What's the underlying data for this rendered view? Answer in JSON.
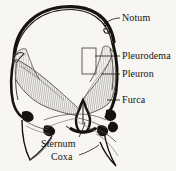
{
  "figure": {
    "background_color": "#f7f6f2",
    "ink_color": "#16120f",
    "hatch_color": "#8d8a84",
    "width": 176,
    "height": 171
  },
  "labels": [
    {
      "id": "notum",
      "text": "Notum",
      "x": 122,
      "y": 13,
      "leader_from": [
        120,
        18
      ],
      "leader_to": [
        104,
        23
      ]
    },
    {
      "id": "pleurodema",
      "text": "Pleurodema",
      "x": 122,
      "y": 51,
      "leader_from": [
        120,
        56
      ],
      "leader_to": [
        94,
        56
      ]
    },
    {
      "id": "pleuron",
      "text": "Pleuron",
      "x": 122,
      "y": 69,
      "leader_from": [
        120,
        74
      ],
      "leader_to": [
        101,
        74
      ]
    },
    {
      "id": "furca",
      "text": "Furca",
      "x": 122,
      "y": 95,
      "leader_from": [
        120,
        100
      ],
      "leader_to": [
        106,
        100
      ]
    },
    {
      "id": "sternum",
      "text": "Sternum",
      "x": 41,
      "y": 139,
      "leader_from": [
        78,
        138
      ],
      "leader_to": [
        85,
        124
      ]
    },
    {
      "id": "coxa",
      "text": "Coxa",
      "x": 51,
      "y": 152,
      "leader_from": [
        78,
        155
      ],
      "leader_to": [
        98,
        146
      ]
    }
  ],
  "structures": [
    {
      "id": "notum-arch",
      "name": "notum-dorsal-arch",
      "description": "thick black dorsal arch spanning the top"
    },
    {
      "id": "pleuron-left",
      "name": "pleuron-left",
      "description": "hatched wing-shaped lateral plate, left"
    },
    {
      "id": "pleuron-right",
      "name": "pleuron-right",
      "description": "hatched wing-shaped lateral plate, right"
    },
    {
      "id": "pleurodema-box",
      "name": "pleurodema-region",
      "description": "small rectangular outlined region on the right pleuron"
    },
    {
      "id": "furca-center",
      "name": "furca-apodeme",
      "description": "black forked median apodeme rising from the sternum"
    },
    {
      "id": "sternum-plate",
      "name": "sternum-plate",
      "description": "ventral median plate at the base of the furca"
    },
    {
      "id": "coxa-left",
      "name": "coxa-left",
      "description": "lower-left leg segment outline"
    },
    {
      "id": "coxa-right",
      "name": "coxa-right",
      "description": "lower-right leg segment outline"
    },
    {
      "id": "pleural-ridge-left",
      "name": "pleural-ridge-left",
      "description": "heavy black lateral margin, left"
    },
    {
      "id": "pleural-ridge-right",
      "name": "pleural-ridge-right",
      "description": "heavy black lateral margin, right"
    }
  ]
}
